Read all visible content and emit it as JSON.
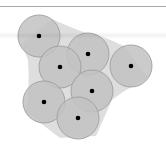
{
  "figure": {
    "type": "union-of-disks-with-hull",
    "width": 166,
    "height": 150,
    "colors": {
      "background": "#ffffff",
      "rule": "#a9a9a9",
      "disk_fill": "#c2c2c2",
      "disk_stroke": "#9e9e9e",
      "hull_fill": "#dedede",
      "center_dot": "#000000"
    },
    "disk_radius": 21,
    "center_dot_radius": 2.3,
    "disks": [
      {
        "id": "p1",
        "cx": 39,
        "cy": 36
      },
      {
        "id": "p2",
        "cx": 88,
        "cy": 54
      },
      {
        "id": "p3",
        "cx": 60,
        "cy": 67
      },
      {
        "id": "p4",
        "cx": 131,
        "cy": 66
      },
      {
        "id": "p5",
        "cx": 92,
        "cy": 91
      },
      {
        "id": "p6",
        "cx": 44,
        "cy": 102
      },
      {
        "id": "p7",
        "cx": 78,
        "cy": 118
      }
    ],
    "hull_path": "M 52 19 Q 72 28 86 33 Q 104 36 124 46 L 148 78 Q 124 90 112 100 L 96 136 L 60 138 L 26 112 Q 30 84 28 60 Q 24 50 22 44 Z"
  }
}
